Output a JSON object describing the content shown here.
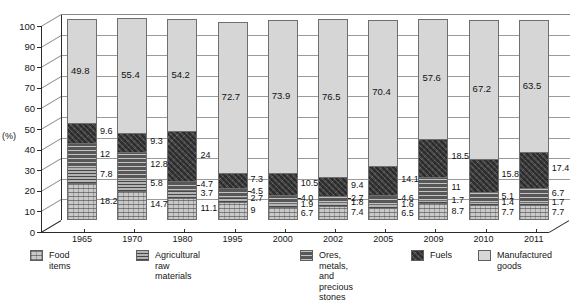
{
  "chart_data": {
    "type": "bar",
    "subtype": "stacked-column-100-3d",
    "title": "",
    "xlabel": "",
    "ylabel": "(%)",
    "ylim": [
      0,
      100
    ],
    "ytick_labels": [
      "0",
      "10",
      "20",
      "30",
      "40",
      "50",
      "60",
      "70",
      "80",
      "90",
      "100"
    ],
    "grid": true,
    "legend_position": "bottom",
    "categories": [
      "1965",
      "1970",
      "1980",
      "1995",
      "2000",
      "2002",
      "2005",
      "2009",
      "2010",
      "2011"
    ],
    "series": [
      {
        "name": "Food items",
        "values": [
          18.2,
          14.7,
          11.1,
          9,
          6.7,
          7.4,
          6.5,
          8.7,
          7.7,
          7.7
        ]
      },
      {
        "name": "Agricultural raw materials",
        "values": [
          7.8,
          5.8,
          3.7,
          2.7,
          1.9,
          1.8,
          1.6,
          1.7,
          1.4,
          1.7
        ]
      },
      {
        "name": "Ores, metals, and precious stones",
        "values": [
          12,
          12.8,
          4.7,
          4.5,
          4.0,
          2.7,
          4.6,
          11,
          5.1,
          6.7
        ]
      },
      {
        "name": "Fuels",
        "values": [
          9.6,
          9.3,
          24,
          7.3,
          10.5,
          9.4,
          14.1,
          18.5,
          15.8,
          17.4
        ]
      },
      {
        "name": "Manufactured goods",
        "values": [
          49.8,
          55.4,
          54.2,
          72.7,
          73.9,
          76.5,
          70.4,
          57.6,
          67.2,
          63.5
        ]
      }
    ],
    "data_labels": {
      "1965": [
        "18.2",
        "7.8",
        "12",
        "9.6",
        "49.8"
      ],
      "1970": [
        "14.7",
        "5.8",
        "12.8",
        "9.3",
        "55.4"
      ],
      "1980": [
        "11.1",
        "3.7",
        "4.7",
        "24",
        "54.2"
      ],
      "1995": [
        "9",
        "2.7",
        "4.5",
        "7.3",
        "72.7"
      ],
      "2000": [
        "6.7",
        "1.9",
        "4.0",
        "10.5",
        "73.9"
      ],
      "2002": [
        "7.4",
        "1.8",
        "2.7",
        "9.4",
        "76.5"
      ],
      "2005": [
        "6.5",
        "1.6",
        "4.6",
        "14.1",
        "70.4"
      ],
      "2009": [
        "8.7",
        "1.7",
        "11",
        "18.5",
        "57.6"
      ],
      "2010": [
        "7.7",
        "1.4",
        "5.1",
        "15.8",
        "67.2"
      ],
      "2011": [
        "7.7",
        "1.7",
        "6.7",
        "17.4",
        "63.5"
      ]
    },
    "colors": {
      "food_items": "#c9c9c9",
      "agricultural_raw_materials": "#b4b4b4",
      "ores_metals_precious_stones": "#575757",
      "fuels": "#4a4a4a",
      "manufactured_goods": "#d6d6d6",
      "axis": "#2b2b2b",
      "gridline": "#9a9a9a"
    }
  },
  "axis": {
    "unit_label": "(%)",
    "y_ticks": [
      "100",
      "90",
      "80",
      "70",
      "60",
      "50",
      "40",
      "30",
      "20",
      "10",
      "0"
    ],
    "x_labels": [
      "1965",
      "1970",
      "1980",
      "1995",
      "2000",
      "2002",
      "2005",
      "2009",
      "2010",
      "2011"
    ]
  },
  "legend": {
    "items": [
      {
        "label": "Food items",
        "swatch": "food-items-swatch"
      },
      {
        "label": "Agricultural raw materials",
        "swatch": "agricultural-raw-materials-swatch"
      },
      {
        "label": "Ores, metals, and\nprecious stones",
        "swatch": "ores-metals-swatch"
      },
      {
        "label": "Fuels",
        "swatch": "fuels-swatch"
      },
      {
        "label": "Manufactured\ngoods",
        "swatch": "manufactured-goods-swatch"
      }
    ]
  },
  "caption": {
    "text": ""
  }
}
